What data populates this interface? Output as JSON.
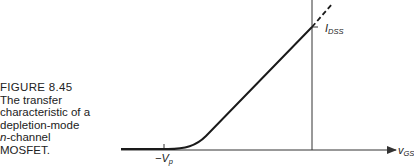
{
  "figure": {
    "number": "FIGURE 8.45",
    "caption_line1": "The transfer",
    "caption_line2": "characteristic of a",
    "caption_line3": "depletion-mode",
    "caption_line4_italic": "n",
    "caption_line4_rest": "-channel",
    "caption_line5": "MOSFET."
  },
  "labels": {
    "idss_main": "I",
    "idss_sub": "DSS",
    "vp_main": "−V",
    "vp_sub": "p",
    "xaxis_main": "v",
    "xaxis_sub": "GS"
  },
  "colors": {
    "curve": "#1a1a1a",
    "axis": "#333333"
  }
}
